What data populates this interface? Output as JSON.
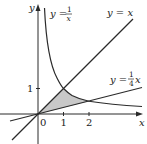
{
  "figure": {
    "axes": {
      "x_label": "x",
      "y_label": "y",
      "origin_label": "0",
      "x_ticks": [
        "1",
        "2"
      ],
      "y_ticks": [
        "1"
      ]
    },
    "curves": [
      {
        "id": "hyperbola",
        "label_lhs": "y =",
        "label_num": "1",
        "label_den": "x",
        "equation": "y = 1/x"
      },
      {
        "id": "identity",
        "label": "y = x",
        "equation": "y = x"
      },
      {
        "id": "quarter",
        "label_lhs": "y =",
        "label_num": "1",
        "label_den": "4",
        "label_var": "x",
        "equation": "y = (1/4)x"
      }
    ],
    "shaded_region": {
      "description": "Region bounded by y = x, y = 1/x, and y = (1/4)x",
      "vertices": [
        [
          0,
          0
        ],
        [
          1,
          1
        ],
        [
          2,
          0.5
        ]
      ],
      "fill": "#c8c8c8"
    },
    "colors": {
      "stroke": "#2a2a2a",
      "shade": "#c8c8c8"
    }
  }
}
